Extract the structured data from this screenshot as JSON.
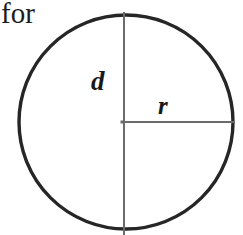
{
  "canvas": {
    "width": 243,
    "height": 235,
    "background_color": "#ffffff"
  },
  "context_text": {
    "word": "for"
  },
  "figure": {
    "name": "circle-with-radius-and-diameter",
    "circle": {
      "center_x": 126,
      "center_y": 122,
      "radius": 107,
      "stroke_color": "#262626",
      "stroke_width": 3.4
    },
    "diameter_line": {
      "label": "d",
      "orientation": "vertical",
      "x": 124,
      "y_start": 12,
      "y_end": 235,
      "stroke_color": "#6b6b6b",
      "stroke_width": 2
    },
    "radius_line": {
      "label": "r",
      "orientation": "horizontal",
      "y": 122,
      "x_start": 124,
      "x_end": 234,
      "stroke_color": "#6b6b6b",
      "stroke_width": 2
    },
    "center_marker": {
      "x": 124,
      "y": 122
    }
  }
}
